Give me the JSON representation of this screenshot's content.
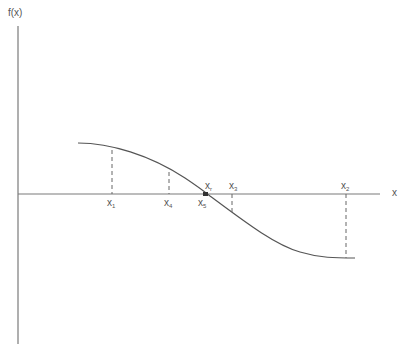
{
  "diagram": {
    "title": "",
    "y_axis_label": "f(x)",
    "x_axis_label": "x",
    "curve": "smooth decreasing function crossing the x-axis at root x_r",
    "points": [
      {
        "name": "x1",
        "base": "x",
        "sub": "1",
        "position": "below-axis"
      },
      {
        "name": "x4",
        "base": "x",
        "sub": "4",
        "position": "below-axis"
      },
      {
        "name": "xr",
        "base": "x",
        "sub": "r",
        "position": "above-axis"
      },
      {
        "name": "x5",
        "base": "x",
        "sub": "5",
        "position": "below-axis"
      },
      {
        "name": "x3",
        "base": "x",
        "sub": "3",
        "position": "above-axis"
      },
      {
        "name": "x2",
        "base": "x",
        "sub": "2",
        "position": "above-axis"
      }
    ],
    "colors": {
      "axis": "#7a7a7a",
      "curve": "#555555",
      "dashed": "#666666",
      "text": "#555555",
      "background": "#ffffff"
    }
  }
}
